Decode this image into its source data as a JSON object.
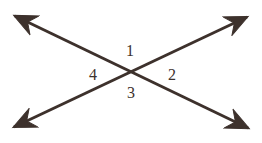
{
  "figure": {
    "type": "geometry-diagram",
    "background_color": "#ffffff",
    "stroke_color": "#3d312c",
    "stroke_width": 3,
    "canvas": {
      "width": 262,
      "height": 143
    },
    "intersection_point": {
      "x": 131,
      "y": 72
    },
    "lines": [
      {
        "name": "line-nw-se",
        "from": {
          "x": 15,
          "y": 16
        },
        "to": {
          "x": 248,
          "y": 128
        },
        "arrowheads": "both"
      },
      {
        "name": "line-sw-ne",
        "from": {
          "x": 14,
          "y": 127
        },
        "to": {
          "x": 247,
          "y": 17
        },
        "arrowheads": "both"
      }
    ],
    "labels": [
      {
        "id": "1",
        "text": "1",
        "position": "top",
        "x": 130,
        "y": 51
      },
      {
        "id": "2",
        "text": "2",
        "position": "right",
        "x": 172,
        "y": 75
      },
      {
        "id": "3",
        "text": "3",
        "position": "bottom",
        "x": 131,
        "y": 93
      },
      {
        "id": "4",
        "text": "4",
        "position": "left",
        "x": 93,
        "y": 75
      }
    ]
  }
}
